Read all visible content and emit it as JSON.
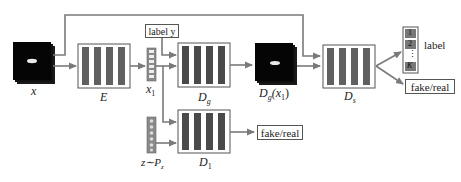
{
  "diagram": {
    "colors": {
      "line": "#7a7a7a",
      "box_border": "#555555",
      "bar_fill": "#606060",
      "image_fill": "#0a0a0a",
      "vector_fill": "#8a8a8a"
    },
    "nodes": {
      "input_image": {
        "label": "x"
      },
      "encoder": {
        "label": "E"
      },
      "latent": {
        "label": "x",
        "subscript": "1"
      },
      "label_y": {
        "text": "label y"
      },
      "generator": {
        "label": "D",
        "subscript": "g"
      },
      "generated_image": {
        "label": "D",
        "subscript": "g",
        "suffix": "(x",
        "suffix_sub": "1",
        "close": ")"
      },
      "discriminator_s": {
        "label": "D",
        "subscript": "s"
      },
      "class_output": {
        "items": [
          "1",
          "2",
          "⋮",
          "K"
        ],
        "label": "label"
      },
      "fake_real_top": {
        "text": "fake/real"
      },
      "noise": {
        "label": "z∼P",
        "subscript": "z"
      },
      "discriminator_1": {
        "label": "D",
        "subscript": "1"
      },
      "fake_real_bottom": {
        "text": "fake/real"
      }
    }
  }
}
